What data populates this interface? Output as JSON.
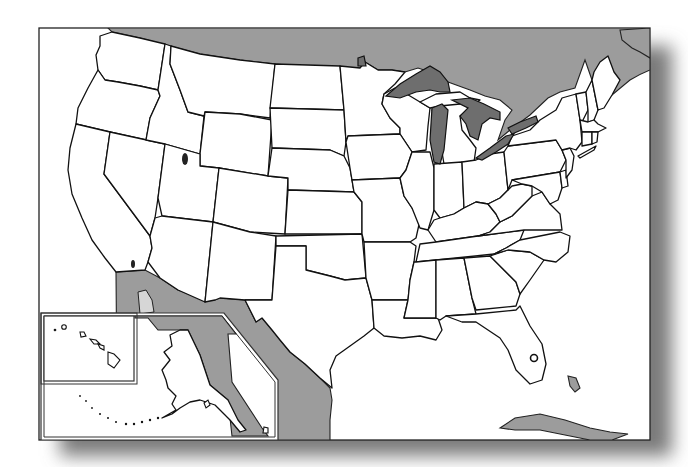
{
  "map": {
    "title": "Blank outline map of the United States",
    "type": "outline map",
    "labels_visible": false,
    "colors": {
      "land_us": "#ffffff",
      "foreign_land": "#9c9c9c",
      "great_lakes": "#6e6e6e",
      "borders": "#111111",
      "ocean": "#ffffff",
      "shadow": "#8a8a8a"
    },
    "regions": {
      "contiguous_states": [
        "Washington",
        "Oregon",
        "California",
        "Nevada",
        "Idaho",
        "Montana",
        "Wyoming",
        "Utah",
        "Arizona",
        "Colorado",
        "New Mexico",
        "North Dakota",
        "South Dakota",
        "Nebraska",
        "Kansas",
        "Oklahoma",
        "Texas",
        "Minnesota",
        "Iowa",
        "Missouri",
        "Arkansas",
        "Louisiana",
        "Wisconsin",
        "Illinois",
        "Michigan",
        "Indiana",
        "Ohio",
        "Kentucky",
        "Tennessee",
        "Mississippi",
        "Alabama",
        "Georgia",
        "Florida",
        "South Carolina",
        "North Carolina",
        "Virginia",
        "West Virginia",
        "Pennsylvania",
        "New York",
        "Maryland",
        "Delaware",
        "New Jersey",
        "Connecticut",
        "Rhode Island",
        "Massachusetts",
        "Vermont",
        "New Hampshire",
        "Maine"
      ],
      "insets": [
        {
          "name": "Hawaii",
          "position": "bottom-left upper"
        },
        {
          "name": "Alaska",
          "position": "bottom-left lower"
        }
      ],
      "foreign": [
        "Canada",
        "Mexico",
        "Cuba",
        "Bahamas"
      ],
      "water_features": [
        "Lake Superior",
        "Lake Michigan",
        "Lake Huron",
        "Lake Erie",
        "Lake Ontario",
        "Great Salt Lake",
        "Salton Sea",
        "Lake Okeechobee"
      ]
    }
  }
}
